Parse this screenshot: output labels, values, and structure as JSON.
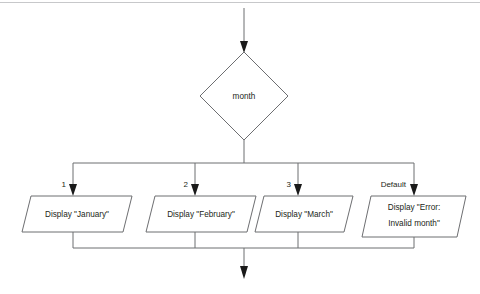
{
  "diagram": {
    "type": "flowchart",
    "title": "",
    "decision": {
      "name": "month-decision",
      "label": "month",
      "shape": "diamond"
    },
    "entry_arrow": {
      "name": "entry-arrow",
      "label": ""
    },
    "exit_arrow": {
      "name": "exit-arrow",
      "label": ""
    },
    "branches": [
      {
        "case_label": "1",
        "shape": "parallelogram",
        "action_lines": [
          "Display \"January\""
        ]
      },
      {
        "case_label": "2",
        "shape": "parallelogram",
        "action_lines": [
          "Display \"February\""
        ]
      },
      {
        "case_label": "3",
        "shape": "parallelogram",
        "action_lines": [
          "Display \"March\""
        ]
      },
      {
        "case_label": "Default",
        "shape": "parallelogram",
        "action_lines": [
          "Display \"Error:",
          "Invalid month\""
        ]
      }
    ],
    "colors": {
      "shape_stroke": "#6d6e71",
      "connector_stroke": "#6d6e71",
      "arrow_fill": "#1a1a1a",
      "text": "#231f20",
      "background": "#ffffff",
      "top_rule": "#c7c8ca"
    }
  }
}
